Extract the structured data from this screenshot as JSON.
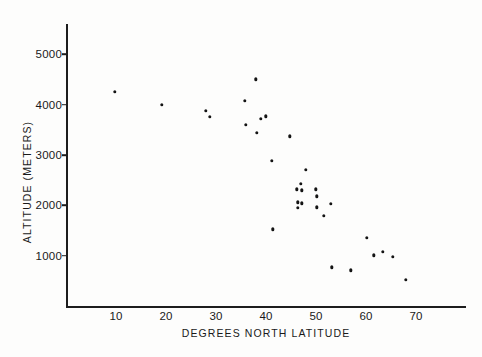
{
  "chart_data": {
    "type": "scatter",
    "title": "",
    "xlabel": "DEGREES NORTH LATITUDE",
    "ylabel": "ALTITUDE (METERS)",
    "xlim": [
      0,
      80
    ],
    "ylim": [
      0,
      5600
    ],
    "grid": false,
    "legend": null,
    "xticks": [
      10,
      20,
      30,
      40,
      50,
      60,
      70
    ],
    "xtick_labels": [
      "10",
      "20",
      "30",
      "40",
      "50",
      "60",
      "70"
    ],
    "yticks": [
      1000,
      2000,
      3000,
      4000,
      5000
    ],
    "ytick_labels": [
      "1000",
      "2000",
      "3000",
      "4000",
      "5000"
    ],
    "marker": "filled-circle",
    "marker_color": "#141414",
    "points": [
      {
        "x": 9.8,
        "y": 4250
      },
      {
        "x": 19.2,
        "y": 3990
      },
      {
        "x": 27.9,
        "y": 3880
      },
      {
        "x": 28.8,
        "y": 3760
      },
      {
        "x": 38.0,
        "y": 4500
      },
      {
        "x": 35.8,
        "y": 4080
      },
      {
        "x": 39.0,
        "y": 3720
      },
      {
        "x": 40.0,
        "y": 3770
      },
      {
        "x": 35.9,
        "y": 3600
      },
      {
        "x": 38.2,
        "y": 3440
      },
      {
        "x": 44.8,
        "y": 3370
      },
      {
        "x": 41.2,
        "y": 2880
      },
      {
        "x": 48.0,
        "y": 2710
      },
      {
        "x": 47.0,
        "y": 2430
      },
      {
        "x": 46.1,
        "y": 2320
      },
      {
        "x": 47.2,
        "y": 2300
      },
      {
        "x": 50.0,
        "y": 2320
      },
      {
        "x": 50.2,
        "y": 2180
      },
      {
        "x": 46.3,
        "y": 2060
      },
      {
        "x": 47.1,
        "y": 2040
      },
      {
        "x": 46.3,
        "y": 1950
      },
      {
        "x": 50.1,
        "y": 1960
      },
      {
        "x": 53.0,
        "y": 2030
      },
      {
        "x": 51.6,
        "y": 1790
      },
      {
        "x": 41.3,
        "y": 1520
      },
      {
        "x": 60.2,
        "y": 1350
      },
      {
        "x": 63.3,
        "y": 1080
      },
      {
        "x": 61.5,
        "y": 1010
      },
      {
        "x": 65.4,
        "y": 980
      },
      {
        "x": 53.1,
        "y": 770
      },
      {
        "x": 57.0,
        "y": 710
      },
      {
        "x": 68.0,
        "y": 520
      }
    ]
  }
}
